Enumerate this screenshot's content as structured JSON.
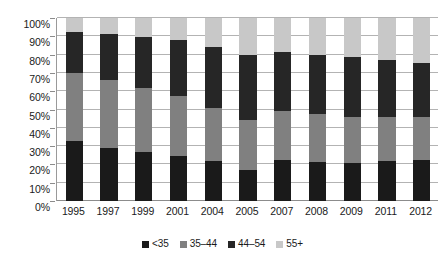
{
  "chart_data": {
    "type": "bar",
    "subtype": "stacked-bar-100-percent",
    "title": "",
    "subtitle": "",
    "xlabel": "",
    "ylabel": "",
    "ylim": [
      0,
      100
    ],
    "ytick_labels": [
      "100%",
      "90%",
      "80%",
      "70%",
      "60%",
      "50%",
      "40%",
      "30%",
      "20%",
      "10%",
      "0%"
    ],
    "ytick_values": [
      100,
      90,
      80,
      70,
      60,
      50,
      40,
      30,
      20,
      10,
      0
    ],
    "grid": true,
    "grid_axis": "y",
    "legend_position": "bottom",
    "categories": [
      "1995",
      "1997",
      "1999",
      "2001",
      "2004",
      "2005",
      "2007",
      "2008",
      "2009",
      "2011",
      "2012"
    ],
    "series": [
      {
        "name": "<35",
        "color": "#1a1a1a",
        "values": [
          33,
          29,
          27,
          24.5,
          22,
          17,
          22.5,
          21.5,
          21,
          22,
          22.5
        ]
      },
      {
        "name": "35–44",
        "color": "#808080",
        "values": [
          37,
          37,
          35,
          33,
          29,
          27,
          26.5,
          26,
          25,
          24,
          23.5
        ]
      },
      {
        "name": "44–54",
        "color": "#262626",
        "values": [
          22.5,
          25,
          27.5,
          30.5,
          33,
          36,
          32.5,
          32.5,
          32.5,
          31,
          29.5
        ]
      },
      {
        "name": "55+",
        "color": "#c8c8c8",
        "values": [
          7.5,
          9,
          10.5,
          12,
          16,
          20,
          18.5,
          20,
          21.5,
          23,
          24.5
        ]
      }
    ],
    "cumulative_tops": {
      "1995": [
        33,
        70,
        92.5,
        100
      ],
      "1997": [
        29,
        66,
        91,
        100
      ],
      "1999": [
        27,
        62,
        89.5,
        100
      ],
      "2001": [
        24.5,
        57.5,
        88,
        100
      ],
      "2004": [
        22,
        51,
        84,
        100
      ],
      "2005": [
        17,
        44,
        80,
        100
      ],
      "2007": [
        22.5,
        49,
        81.5,
        100
      ],
      "2008": [
        21.5,
        47.5,
        80,
        100
      ],
      "2009": [
        21,
        46,
        78.5,
        100
      ],
      "2011": [
        22,
        46,
        77,
        100
      ],
      "2012": [
        22.5,
        46,
        75.5,
        100
      ]
    }
  },
  "legend": {
    "items": [
      {
        "label": "<35",
        "color": "#1a1a1a"
      },
      {
        "label": "35–44",
        "color": "#808080"
      },
      {
        "label": "44–54",
        "color": "#262626"
      },
      {
        "label": "55+",
        "color": "#c8c8c8"
      }
    ]
  },
  "colors": {
    "background": "#ffffff",
    "gridline": "#b3b3b3",
    "axis": "#8c8c8c",
    "text": "#1a1a1a"
  }
}
